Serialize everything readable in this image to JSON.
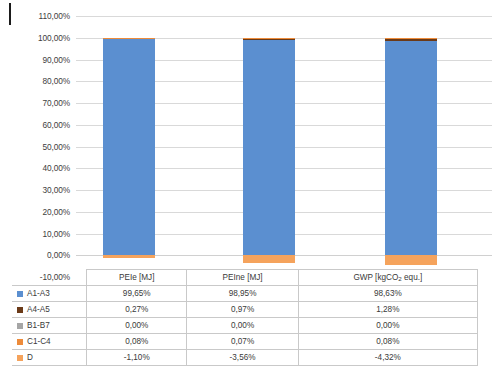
{
  "chart_data": {
    "type": "bar",
    "subtype": "stacked-column",
    "title": "",
    "xlabel": "",
    "ylabel": "",
    "ylim": [
      -10,
      110
    ],
    "ytick_labels": [
      "110,00%",
      "100,00%",
      "90,00%",
      "80,00%",
      "70,00%",
      "60,00%",
      "50,00%",
      "40,00%",
      "30,00%",
      "20,00%",
      "10,00%",
      "0,00%",
      "-10,00%"
    ],
    "ytick_values": [
      110,
      100,
      90,
      80,
      70,
      60,
      50,
      40,
      30,
      20,
      10,
      0,
      -10
    ],
    "grid": true,
    "legend_position": "table-left",
    "categories": [
      "PEIe [MJ]",
      "PEIne [MJ]",
      "GWP [kgCO2 equ.]"
    ],
    "series": [
      {
        "name": "A1-A3",
        "color": "#5b8fd0",
        "values": [
          99.65,
          98.95,
          98.63
        ],
        "labels": [
          "99,65%",
          "98,95%",
          "98,63%"
        ]
      },
      {
        "name": "A4-A5",
        "color": "#6b3a18",
        "values": [
          0.27,
          0.97,
          1.28
        ],
        "labels": [
          "0,27%",
          "0,97%",
          "1,28%"
        ]
      },
      {
        "name": "B1-B7",
        "color": "#a6a6a6",
        "values": [
          0.0,
          0.0,
          0.0
        ],
        "labels": [
          "0,00%",
          "0,00%",
          "0,00%"
        ]
      },
      {
        "name": "C1-C4",
        "color": "#ed8b3a",
        "values": [
          0.08,
          0.07,
          0.08
        ],
        "labels": [
          "0,08%",
          "0,07%",
          "0,08%"
        ]
      },
      {
        "name": "D",
        "color": "#f5a35c",
        "values": [
          -1.1,
          -3.56,
          -4.32
        ],
        "labels": [
          "-1,10%",
          "-3,56%",
          "-4,32%"
        ]
      }
    ]
  },
  "table": {
    "header": {
      "corner": "",
      "columns": [
        "PEIe [MJ]",
        "PEIne [MJ]",
        "GWP [kgCO"
      ]
    },
    "gwp_subscript": "2",
    "gwp_suffix": " equ.]",
    "rows": [
      {
        "label": "A1-A3",
        "color": "#5b8fd0",
        "values": [
          "99,65%",
          "98,95%",
          "98,63%"
        ]
      },
      {
        "label": "A4-A5",
        "color": "#6b3a18",
        "values": [
          "0,27%",
          "0,97%",
          "1,28%"
        ]
      },
      {
        "label": "B1-B7",
        "color": "#a6a6a6",
        "values": [
          "0,00%",
          "0,00%",
          "0,00%"
        ]
      },
      {
        "label": "C1-C4",
        "color": "#ed8b3a",
        "values": [
          "0,08%",
          "0,07%",
          "0,08%"
        ]
      },
      {
        "label": "D",
        "color": "#f5a35c",
        "values": [
          "-1,10%",
          "-3,56%",
          "-4,32%"
        ]
      }
    ]
  }
}
